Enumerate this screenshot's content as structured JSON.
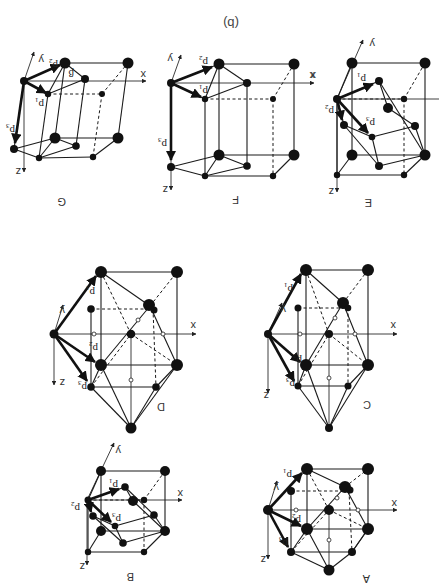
{
  "figure": {
    "title": "(b)",
    "orientation": "rotated 180 degrees",
    "panels": [
      {
        "id": "A",
        "label": "A",
        "vectors": [
          "p1",
          "p2",
          "p3"
        ],
        "axes": [
          "x",
          "y",
          "z"
        ]
      },
      {
        "id": "B",
        "label": "B",
        "vectors": [
          "p1",
          "p2",
          "p3"
        ],
        "axes": [
          "x",
          "y",
          "z"
        ]
      },
      {
        "id": "C",
        "label": "C",
        "vectors": [
          "p1",
          "p2",
          "p3"
        ],
        "axes": [
          "x",
          "y",
          "z"
        ]
      },
      {
        "id": "D",
        "label": "D",
        "vectors": [
          "p1",
          "p2",
          "p3"
        ],
        "axes": [
          "x",
          "y",
          "z"
        ]
      },
      {
        "id": "E",
        "label": "E",
        "vectors": [
          "p1",
          "p2",
          "p3"
        ],
        "axes": [
          "x",
          "y",
          "z"
        ]
      },
      {
        "id": "F",
        "label": "F",
        "vectors": [
          "p1",
          "p2",
          "p3"
        ],
        "axes": [
          "x",
          "y",
          "z"
        ]
      },
      {
        "id": "G",
        "label": "G",
        "vectors": [
          "p1",
          "p2",
          "p3"
        ],
        "axes": [
          "x",
          "y",
          "z"
        ],
        "angle_label": "β"
      }
    ],
    "labels": {
      "x": "x",
      "y": "y",
      "z": "z",
      "p1": "p",
      "p2": "p",
      "p3": "p",
      "s1": "1",
      "s2": "2",
      "s3": "3",
      "beta": "β"
    }
  }
}
